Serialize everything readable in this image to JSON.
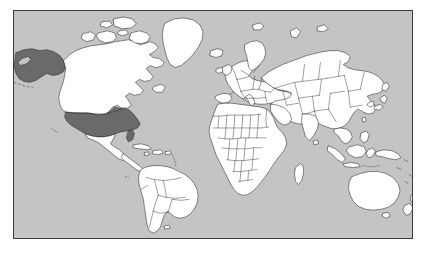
{
  "figure": {
    "type": "world-map",
    "projection": "equirectangular",
    "page_background": "#ffffff"
  },
  "frame": {
    "border_color": "#3c3c3c",
    "border_width_px": 1.4,
    "left_px": 13,
    "top_px": 10,
    "width_px": 400,
    "height_px": 229
  },
  "legend": {
    "ocean_color": "#c4c4c4",
    "land_color": "#ffffff",
    "land_border_color": "#2b2b2b",
    "highlight_color": "#6a6a6a",
    "highlight_label": "United States"
  },
  "highlighted_regions": [
    {
      "name": "United States (contiguous)",
      "color": "#6a6a6a"
    },
    {
      "name": "Alaska",
      "color": "#6a6a6a"
    }
  ],
  "continents": [
    {
      "name": "North America"
    },
    {
      "name": "South America"
    },
    {
      "name": "Europe"
    },
    {
      "name": "Africa"
    },
    {
      "name": "Asia"
    },
    {
      "name": "Oceania"
    }
  ],
  "notable_features": [
    {
      "name": "Greenland"
    },
    {
      "name": "Canada"
    },
    {
      "name": "Mexico"
    },
    {
      "name": "Brazil"
    },
    {
      "name": "Russia"
    },
    {
      "name": "China"
    },
    {
      "name": "India"
    },
    {
      "name": "Australia"
    },
    {
      "name": "New Zealand"
    },
    {
      "name": "Japan"
    },
    {
      "name": "Madagascar"
    },
    {
      "name": "Indonesia"
    },
    {
      "name": "British Isles"
    },
    {
      "name": "Scandinavia"
    },
    {
      "name": "Iceland"
    }
  ]
}
